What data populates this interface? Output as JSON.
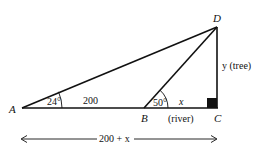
{
  "points": {
    "A": {
      "label": "A"
    },
    "B": {
      "label": "B"
    },
    "C": {
      "label": "C"
    },
    "D": {
      "label": "D"
    }
  },
  "angles": {
    "A": "24°",
    "B": "50°"
  },
  "segments": {
    "AB": "200",
    "BC_var": "x",
    "BC_note": "(river)",
    "DC": "y (tree)",
    "AC_total": "200 + x"
  },
  "colors": {
    "line": "#111111",
    "background": "#ffffff"
  }
}
